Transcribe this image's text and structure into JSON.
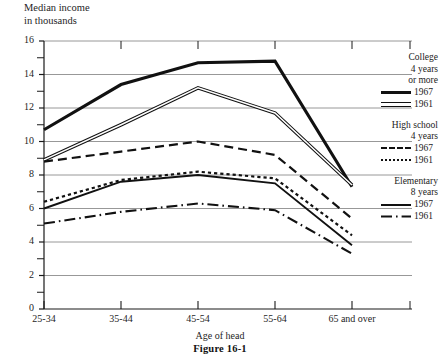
{
  "chart_data": {
    "type": "line",
    "title": "",
    "ylabel": "Median income\nin thousands",
    "xlabel": "Age of head",
    "caption": "Figure 16-1",
    "categories": [
      "25-34",
      "35-44",
      "45-54",
      "55-64",
      "65 and over"
    ],
    "ylim": [
      0,
      16
    ],
    "ytick_labels": [
      "0",
      "2",
      "4",
      "6",
      "8",
      "10",
      "12",
      "14",
      "16"
    ],
    "ytick_values": [
      0,
      2,
      4,
      6,
      8,
      10,
      12,
      14,
      16
    ],
    "minor_ytick_values": [
      1,
      3,
      5,
      7,
      9,
      11,
      13,
      15
    ],
    "grid": true,
    "legend_position": "right",
    "series": [
      {
        "name": "College 4 years or more, 1967",
        "group": "College\n4 years\nor more",
        "year": "1967",
        "style": "solid-thick",
        "values": [
          10.7,
          13.4,
          14.7,
          14.8,
          7.3
        ]
      },
      {
        "name": "College 4 years or more, 1961",
        "group": "College\n4 years\nor more",
        "year": "1961",
        "style": "double-line",
        "values": [
          8.9,
          11.0,
          13.2,
          11.7,
          7.4
        ]
      },
      {
        "name": "High school 4 years, 1967",
        "group": "High school\n4 years",
        "year": "1967",
        "style": "dashed",
        "values": [
          8.8,
          9.4,
          10.0,
          9.2,
          5.4
        ]
      },
      {
        "name": "High school 4 years, 1961",
        "group": "High school\n4 years",
        "year": "1961",
        "style": "dotted",
        "values": [
          6.4,
          7.7,
          8.2,
          7.8,
          4.4
        ]
      },
      {
        "name": "Elementary 8 years, 1967",
        "group": "Elementary\n8 years",
        "year": "1967",
        "style": "solid",
        "values": [
          6.0,
          7.6,
          8.0,
          7.5,
          3.8
        ]
      },
      {
        "name": "Elementary 8 years, 1961",
        "group": "Elementary\n8 years",
        "year": "1961",
        "style": "dash-dot",
        "values": [
          5.1,
          5.8,
          6.3,
          5.9,
          3.3
        ]
      }
    ]
  },
  "legend": {
    "groups": [
      {
        "heading": "College\n4 years\nor more",
        "entries": [
          {
            "label": "1967",
            "style": "solid-thick"
          },
          {
            "label": "1961",
            "style": "double-line"
          }
        ]
      },
      {
        "heading": "High school\n4 years",
        "entries": [
          {
            "label": "1967",
            "style": "dashed"
          },
          {
            "label": "1961",
            "style": "dotted"
          }
        ]
      },
      {
        "heading": "Elementary\n8 years",
        "entries": [
          {
            "label": "1967",
            "style": "solid"
          },
          {
            "label": "1961",
            "style": "dash-dot"
          }
        ]
      }
    ]
  },
  "axes": {
    "y_label_line1": "Median income",
    "y_label_line2": "in thousands",
    "x_label": "Age of head"
  },
  "caption": "Figure 16-1"
}
